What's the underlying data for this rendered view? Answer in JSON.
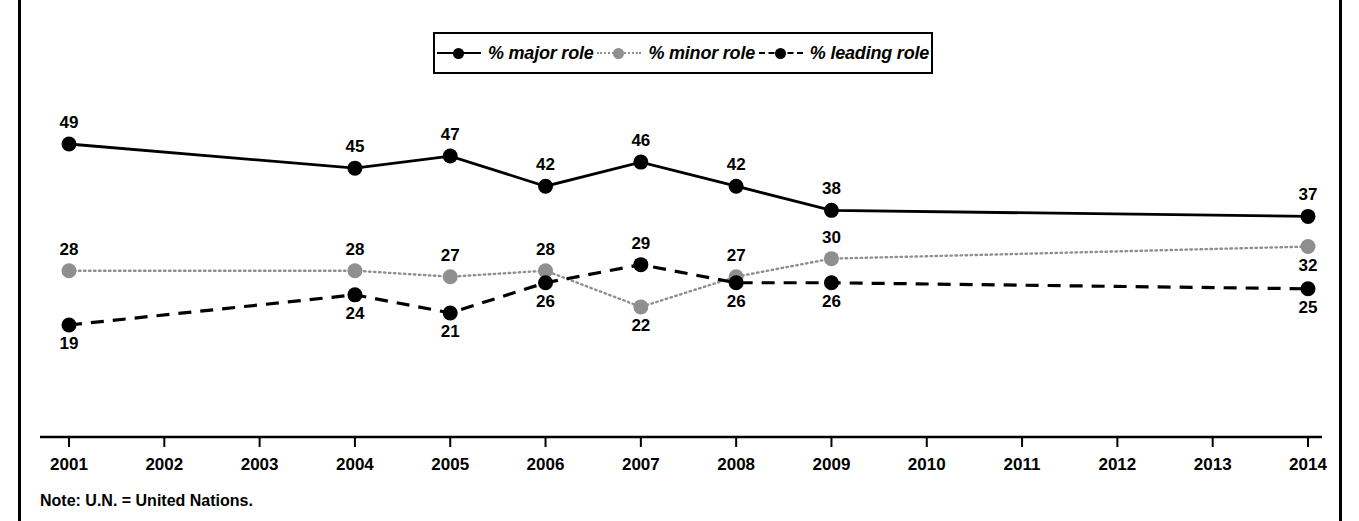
{
  "chart_data": {
    "type": "line",
    "title": "",
    "subtitle": "",
    "xlabel": "",
    "ylabel": "",
    "grid": false,
    "legend_position": "top-center",
    "x": [
      2001,
      2002,
      2003,
      2004,
      2005,
      2006,
      2007,
      2008,
      2009,
      2010,
      2011,
      2012,
      2013,
      2014
    ],
    "categories": [
      "2001",
      "2002",
      "2003",
      "2004",
      "2005",
      "2006",
      "2007",
      "2008",
      "2009",
      "2010",
      "2011",
      "2012",
      "2013",
      "2014"
    ],
    "xlim": [
      2001,
      2014
    ],
    "ylim": [
      0,
      55
    ],
    "series": [
      {
        "name": "% major role",
        "color": "#000000",
        "line_style": "solid",
        "marker": "circle",
        "points": [
          {
            "x": 2001,
            "value": 49,
            "label": "49",
            "label_pos": "above"
          },
          {
            "x": 2004,
            "value": 45,
            "label": "45",
            "label_pos": "above"
          },
          {
            "x": 2005,
            "value": 47,
            "label": "47",
            "label_pos": "above"
          },
          {
            "x": 2006,
            "value": 42,
            "label": "42",
            "label_pos": "above"
          },
          {
            "x": 2007,
            "value": 46,
            "label": "46",
            "label_pos": "above"
          },
          {
            "x": 2008,
            "value": 42,
            "label": "42",
            "label_pos": "above"
          },
          {
            "x": 2009,
            "value": 38,
            "label": "38",
            "label_pos": "above"
          },
          {
            "x": 2014,
            "value": 37,
            "label": "37",
            "label_pos": "above"
          }
        ]
      },
      {
        "name": "% minor role",
        "color": "#8f8f8f",
        "line_style": "dotted",
        "marker": "circle",
        "points": [
          {
            "x": 2001,
            "value": 28,
            "label": "28",
            "label_pos": "above"
          },
          {
            "x": 2004,
            "value": 28,
            "label": "28",
            "label_pos": "above"
          },
          {
            "x": 2005,
            "value": 27,
            "label": "27",
            "label_pos": "above"
          },
          {
            "x": 2006,
            "value": 28,
            "label": "28",
            "label_pos": "above"
          },
          {
            "x": 2007,
            "value": 22,
            "label": "22",
            "label_pos": "below"
          },
          {
            "x": 2008,
            "value": 27,
            "label": "27",
            "label_pos": "above"
          },
          {
            "x": 2009,
            "value": 30,
            "label": "30",
            "label_pos": "above"
          },
          {
            "x": 2014,
            "value": 32,
            "label": "32",
            "label_pos": "below"
          }
        ]
      },
      {
        "name": "% leading role",
        "color": "#000000",
        "line_style": "dashed",
        "marker": "circle",
        "points": [
          {
            "x": 2001,
            "value": 19,
            "label": "19",
            "label_pos": "below"
          },
          {
            "x": 2004,
            "value": 24,
            "label": "24",
            "label_pos": "below"
          },
          {
            "x": 2005,
            "value": 21,
            "label": "21",
            "label_pos": "below"
          },
          {
            "x": 2006,
            "value": 26,
            "label": "26",
            "label_pos": "below"
          },
          {
            "x": 2007,
            "value": 29,
            "label": "29",
            "label_pos": "above"
          },
          {
            "x": 2008,
            "value": 26,
            "label": "26",
            "label_pos": "below"
          },
          {
            "x": 2009,
            "value": 26,
            "label": "26",
            "label_pos": "below"
          },
          {
            "x": 2014,
            "value": 25,
            "label": "25",
            "label_pos": "below"
          }
        ]
      }
    ]
  },
  "legend": {
    "entries": [
      {
        "label": "% major role",
        "style": "lg-major"
      },
      {
        "label": "% minor role",
        "style": "lg-minor"
      },
      {
        "label": "% leading role",
        "style": "lg-leading"
      }
    ]
  },
  "note": {
    "text": "Note: U.N. = United Nations."
  }
}
